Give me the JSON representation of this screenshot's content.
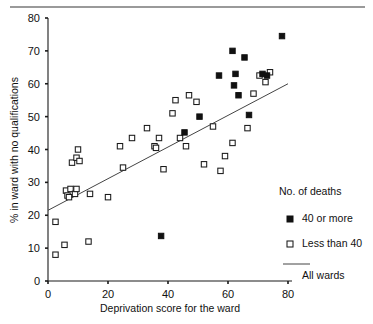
{
  "chart_data": {
    "type": "scatter",
    "title": "",
    "xlabel": "Deprivation score for the ward",
    "ylabel": "% in ward with no qualifications",
    "xlim": [
      0,
      80
    ],
    "ylim": [
      0,
      80
    ],
    "xticks": [
      0,
      20,
      40,
      60,
      80
    ],
    "yticks": [
      0,
      10,
      20,
      30,
      40,
      50,
      60,
      70,
      80
    ],
    "grid": false,
    "legend_position": "right",
    "legend_title": "No. of deaths",
    "series": [
      {
        "name": "40 or more",
        "marker": "filled-square",
        "points": [
          [
            37.7,
            13.7
          ],
          [
            45.5,
            45.2
          ],
          [
            50.5,
            50.0
          ],
          [
            57.0,
            62.5
          ],
          [
            61.5,
            70.0
          ],
          [
            62.0,
            59.5
          ],
          [
            62.5,
            63.0
          ],
          [
            63.5,
            56.5
          ],
          [
            65.5,
            68.0
          ],
          [
            67.0,
            50.5
          ],
          [
            71.5,
            63.0
          ],
          [
            73.0,
            62.5
          ],
          [
            78.0,
            74.5
          ]
        ]
      },
      {
        "name": "Less than 40",
        "marker": "open-square",
        "points": [
          [
            2.5,
            8.0
          ],
          [
            2.5,
            18.0
          ],
          [
            5.5,
            11.0
          ],
          [
            6.0,
            27.5
          ],
          [
            6.5,
            26.0
          ],
          [
            7.0,
            25.5
          ],
          [
            7.5,
            28.0
          ],
          [
            8.0,
            36.0
          ],
          [
            9.0,
            26.5
          ],
          [
            9.5,
            37.5
          ],
          [
            9.5,
            28.0
          ],
          [
            10.0,
            40.0
          ],
          [
            10.5,
            36.5
          ],
          [
            13.5,
            12.0
          ],
          [
            14.0,
            26.5
          ],
          [
            20.0,
            25.5
          ],
          [
            24.0,
            41.0
          ],
          [
            25.0,
            34.5
          ],
          [
            28.0,
            43.5
          ],
          [
            33.0,
            46.5
          ],
          [
            35.5,
            41.0
          ],
          [
            36.0,
            40.5
          ],
          [
            37.0,
            43.5
          ],
          [
            38.5,
            34.0
          ],
          [
            41.5,
            51.0
          ],
          [
            42.5,
            55.0
          ],
          [
            44.0,
            43.5
          ],
          [
            46.0,
            41.0
          ],
          [
            47.0,
            56.5
          ],
          [
            49.5,
            54.5
          ],
          [
            52.0,
            35.5
          ],
          [
            55.0,
            47.0
          ],
          [
            57.5,
            33.5
          ],
          [
            59.0,
            38.0
          ],
          [
            61.5,
            42.0
          ],
          [
            66.5,
            46.5
          ],
          [
            68.5,
            57.0
          ],
          [
            70.5,
            62.5
          ],
          [
            72.5,
            60.5
          ],
          [
            74.0,
            63.5
          ]
        ]
      }
    ],
    "fit_line": {
      "name": "All wards",
      "x0": 0,
      "y0": 21.5,
      "x1": 80,
      "y1": 60.0
    },
    "annotations": []
  },
  "axes": {
    "y_tick_labels": [
      "0",
      "10",
      "20",
      "30",
      "40",
      "50",
      "60",
      "70",
      "80"
    ],
    "x_tick_labels": [
      "0",
      "20",
      "40",
      "60",
      "80"
    ],
    "x_title": "Deprivation score for the ward",
    "y_title": "% in ward with no qualifications"
  },
  "legend": {
    "title": "No. of deaths",
    "items": [
      {
        "label": "40 or more",
        "marker": "filled-square"
      },
      {
        "label": "Less than 40",
        "marker": "open-square"
      },
      {
        "label": "All wards",
        "marker": "line"
      }
    ]
  }
}
